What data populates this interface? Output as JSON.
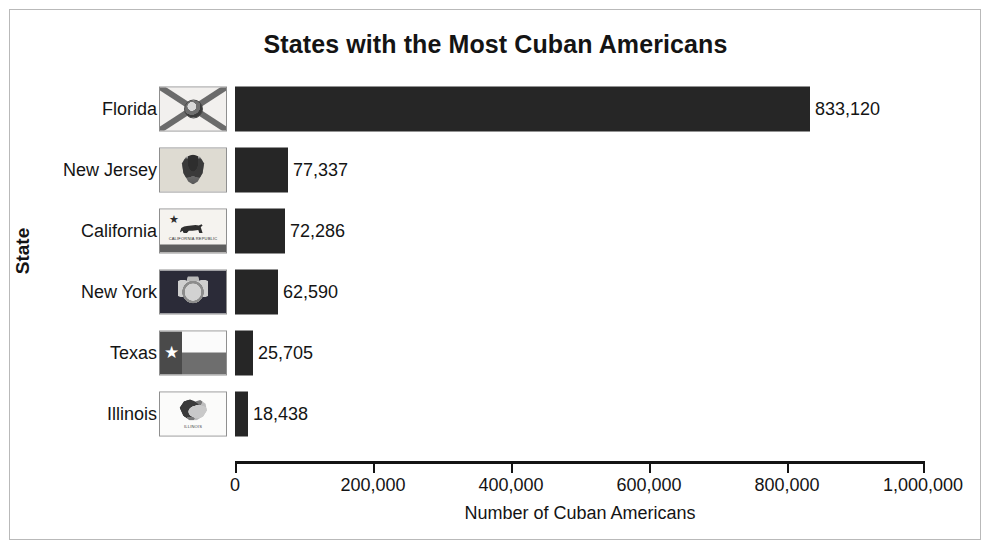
{
  "chart_data": {
    "type": "bar",
    "orientation": "horizontal",
    "title": "States with the Most Cuban Americans",
    "xlabel": "Number of Cuban Americans",
    "ylabel": "State",
    "categories": [
      "Florida",
      "New Jersey",
      "California",
      "New York",
      "Texas",
      "Illinois"
    ],
    "values": [
      833120,
      77337,
      72286,
      62590,
      25705,
      18438
    ],
    "value_labels": [
      "833,120",
      "77,337",
      "72,286",
      "62,590",
      "25,705",
      "18,438"
    ],
    "xlim": [
      0,
      1000000
    ],
    "xticks": [
      0,
      200000,
      400000,
      600000,
      800000,
      1000000
    ],
    "xtick_labels": [
      "0",
      "200,000",
      "400,000",
      "600,000",
      "800,000",
      "1,000,000"
    ],
    "grid": false,
    "legend": "none",
    "bar_color": "#262626",
    "background_color": "#ffffff",
    "series": [
      {
        "name": "Number of Cuban Americans",
        "values": [
          833120,
          77337,
          72286,
          62590,
          25705,
          18438
        ]
      }
    ]
  },
  "rows": [
    {
      "label": "Florida",
      "value_label": "833,120",
      "flag": "florida-flag-icon"
    },
    {
      "label": "New Jersey",
      "value_label": "77,337",
      "flag": "new-jersey-flag-icon"
    },
    {
      "label": "California",
      "value_label": "72,286",
      "flag": "california-flag-icon"
    },
    {
      "label": "New York",
      "value_label": "62,590",
      "flag": "new-york-flag-icon"
    },
    {
      "label": "Texas",
      "value_label": "25,705",
      "flag": "texas-flag-icon"
    },
    {
      "label": "Illinois",
      "value_label": "18,438",
      "flag": "illinois-flag-icon"
    }
  ],
  "flag_captions": {
    "california": "CALIFORNIA REPUBLIC",
    "illinois": "ILLINOIS"
  }
}
